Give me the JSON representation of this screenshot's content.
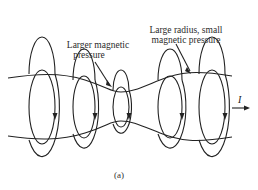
{
  "figure": {
    "caption": "(a)",
    "annotations": {
      "neck": {
        "line1": "Larger magnetic",
        "line2": "pressure"
      },
      "wide": {
        "line1": "Large radius, small",
        "line2": "magnetic pressure"
      }
    },
    "current": {
      "symbol": "I",
      "direction": "right"
    },
    "field_loops": [
      {
        "id": "loop-1",
        "cx": 42,
        "rx": 13,
        "ry": 37,
        "arrow": "down"
      },
      {
        "id": "loop-2",
        "cx": 84,
        "rx": 11,
        "ry": 31,
        "arrow": "down"
      },
      {
        "id": "loop-3",
        "cx": 121,
        "rx": 8,
        "ry": 20,
        "arrow": "down"
      },
      {
        "id": "loop-4",
        "cx": 170,
        "rx": 12,
        "ry": 31,
        "arrow": "down"
      },
      {
        "id": "loop-5",
        "cx": 212,
        "rx": 13,
        "ry": 37,
        "arrow": "down"
      }
    ],
    "colors": {
      "line": "#222222",
      "text": "#2a2a2a",
      "background": "#ffffff"
    }
  }
}
